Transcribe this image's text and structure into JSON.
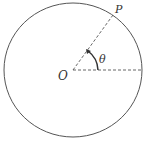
{
  "diagram": {
    "type": "unit-circle-angle",
    "labels": {
      "center": "O",
      "point": "P",
      "angle": "θ"
    },
    "circle": {
      "cx": 73,
      "cy": 70,
      "rx": 69,
      "ry": 67
    },
    "radius_line": {
      "from": [
        73,
        70
      ],
      "to": [
        113,
        15
      ],
      "style": "dashed"
    },
    "reference_line": {
      "from": [
        73,
        70
      ],
      "to": [
        142,
        70
      ],
      "style": "dashed"
    },
    "colors": {
      "stroke": "#555555",
      "text": "#333333",
      "background": "#ffffff"
    }
  }
}
